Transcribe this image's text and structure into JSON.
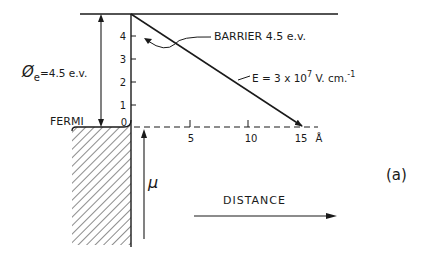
{
  "diagram": {
    "panel_label": "(a)",
    "work_function": {
      "symbol": "Ø",
      "subscript": "e",
      "value": "=4.5 e.v."
    },
    "barrier_label": "BARRIER 4.5 e.v.",
    "field_label": {
      "prefix": "E = 3 x 10",
      "exponent": "7",
      "unit": " V. cm.",
      "unit_exp": "-1"
    },
    "fermi_label": "FERMI",
    "mu_label": "μ",
    "distance_label": "DISTANCE",
    "y_axis_ticks": [
      "0",
      "1",
      "2",
      "3",
      "4"
    ],
    "x_axis_ticks": [
      "5",
      "10",
      "15"
    ],
    "x_axis_unit": "Å",
    "colors": {
      "ink": "#1a1a1a",
      "background": "#ffffff"
    }
  }
}
